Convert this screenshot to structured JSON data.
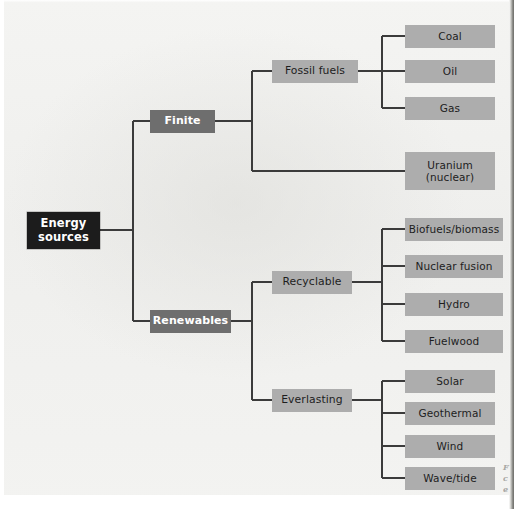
{
  "diagram": {
    "type": "tree",
    "orientation": "left-to-right",
    "colors": {
      "root_fill": "#1c1c1c",
      "root_text": "#ffffff",
      "level2_fill": "#6e6e6e",
      "level2_text": "#ffffff",
      "level3_fill": "#adadad",
      "level3_text": "#1d1d1d",
      "leaf_fill": "#adadad",
      "leaf_text": "#1d1d1d",
      "connector": "#3b3b3b",
      "background": "#f2f2f0"
    }
  },
  "root": {
    "label": "Energy\nsources"
  },
  "level2": {
    "finite": "Finite",
    "renewables": "Renewables"
  },
  "level3": {
    "fossil_fuels": "Fossil fuels",
    "recyclable": "Recyclable",
    "everlasting": "Everlasting"
  },
  "leaves": {
    "coal": "Coal",
    "oil": "Oil",
    "gas": "Gas",
    "uranium": "Uranium\n(nuclear)",
    "biofuels": "Biofuels/biomass",
    "nuclear_fusion": "Nuclear fusion",
    "hydro": "Hydro",
    "fuelwood": "Fuelwood",
    "solar": "Solar",
    "geothermal": "Geothermal",
    "wind": "Wind",
    "wave_tide": "Wave/tide"
  },
  "caption_fragments": {
    "line1": "F",
    "line2": "c",
    "line3": "e"
  }
}
